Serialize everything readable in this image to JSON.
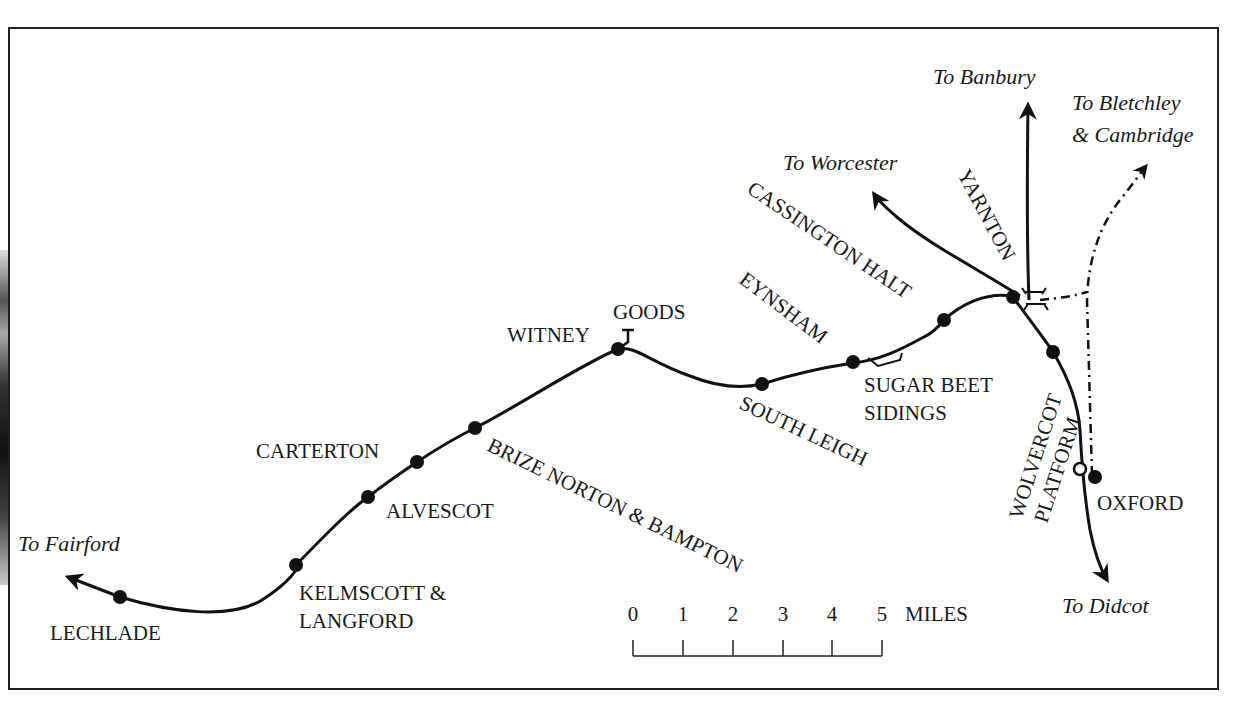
{
  "map": {
    "type": "railway route map",
    "colors": {
      "ink": "#111111",
      "paper": "#ffffff"
    },
    "destinations": {
      "fairford": "To Fairford",
      "worcester": "To Worcester",
      "banbury": "To Banbury",
      "bletchley_1": "To Bletchley",
      "bletchley_2": "& Cambridge",
      "didcot": "To Didcot"
    },
    "stations": [
      {
        "id": "lechlade",
        "label": "LECHLADE"
      },
      {
        "id": "kelmscott",
        "label_1": "KELMSCOTT &",
        "label_2": "LANGFORD"
      },
      {
        "id": "alvescot",
        "label": "ALVESCOT"
      },
      {
        "id": "carterton",
        "label": "CARTERTON"
      },
      {
        "id": "brize-norton",
        "label": "BRIZE NORTON & BAMPTON"
      },
      {
        "id": "witney",
        "label": "WITNEY"
      },
      {
        "id": "witney-goods",
        "label": "GOODS"
      },
      {
        "id": "south-leigh",
        "label": "SOUTH LEIGH"
      },
      {
        "id": "eynsham",
        "label": "EYNSHAM"
      },
      {
        "id": "sugar-beet",
        "label_1": "SUGAR BEET",
        "label_2": "SIDINGS"
      },
      {
        "id": "cassington",
        "label": "CASSINGTON HALT"
      },
      {
        "id": "yarnton",
        "label": "YARNTON"
      },
      {
        "id": "wolvercot",
        "label_1": "WOLVERCOT",
        "label_2": "PLATFORM"
      },
      {
        "id": "oxford",
        "label": "OXFORD"
      }
    ],
    "scale": {
      "ticks": [
        "0",
        "1",
        "2",
        "3",
        "4",
        "5"
      ],
      "unit": "MILES"
    }
  }
}
